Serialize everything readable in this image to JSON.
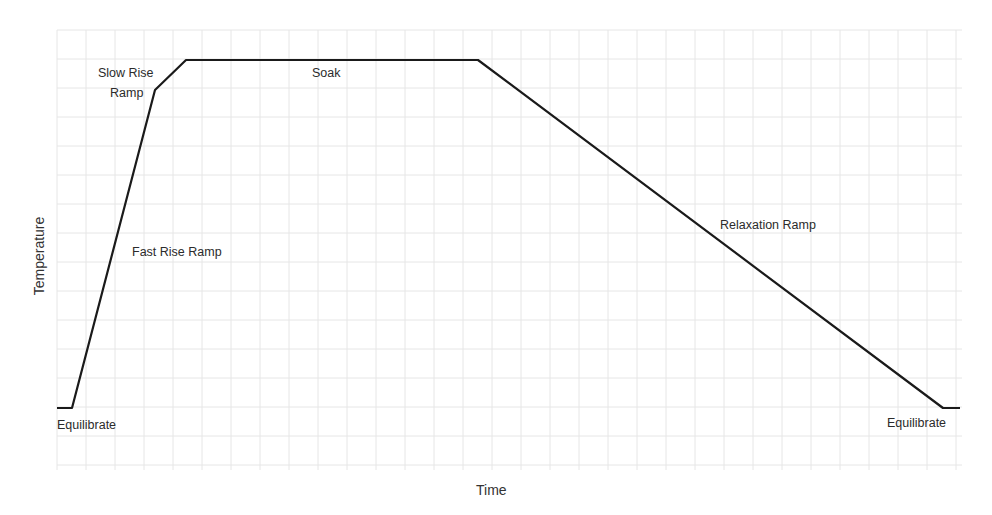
{
  "chart_data": {
    "type": "line",
    "title": "",
    "xlabel": "Time",
    "ylabel": "Temperature",
    "grid": true,
    "legend": null,
    "axis_ticks": "none (no numeric tick labels shown)",
    "series": [
      {
        "name": "Temperature profile",
        "points_px": [
          [
            57,
            408
          ],
          [
            72,
            408
          ],
          [
            155,
            90
          ],
          [
            186,
            60
          ],
          [
            478,
            60
          ],
          [
            943,
            408
          ],
          [
            960,
            408
          ]
        ],
        "segments": [
          "Equilibrate",
          "Fast Rise Ramp",
          "Slow Rise Ramp",
          "Soak",
          "Relaxation Ramp",
          "Equilibrate"
        ]
      }
    ],
    "annotations": [
      {
        "text": "Slow Rise",
        "x": 98,
        "y": 66
      },
      {
        "text": "Ramp",
        "x": 110,
        "y": 86
      },
      {
        "text": "Soak",
        "x": 312,
        "y": 66
      },
      {
        "text": "Fast Rise Ramp",
        "x": 132,
        "y": 245
      },
      {
        "text": "Relaxation Ramp",
        "x": 720,
        "y": 218
      },
      {
        "text": "Equilibrate",
        "x": 57,
        "y": 418
      },
      {
        "text": "Equilibrate",
        "x": 887,
        "y": 416
      }
    ]
  },
  "labels": {
    "slow_rise_1": "Slow Rise",
    "slow_rise_2": "Ramp",
    "soak": "Soak",
    "fast_rise": "Fast Rise Ramp",
    "relaxation": "Relaxation Ramp",
    "equilibrate_left": "Equilibrate",
    "equilibrate_right": "Equilibrate",
    "x_axis": "Time",
    "y_axis": "Temperature"
  },
  "colors": {
    "line": "#1a1a1a",
    "grid": "#e6e6e6",
    "text": "#2b2b2b"
  }
}
